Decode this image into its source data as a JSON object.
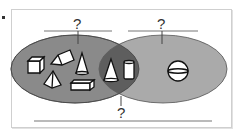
{
  "diagram": {
    "type": "venn",
    "sets": [
      {
        "id": "left",
        "label": "?",
        "color": "#8a8a8a",
        "items": [
          "cube",
          "triangular-prism",
          "cone",
          "square-pyramid",
          "rectangular-prism"
        ]
      },
      {
        "id": "right",
        "label": "?",
        "color": "#aaaaaa",
        "items": [
          "sphere"
        ]
      }
    ],
    "intersection": {
      "label": "?",
      "color": "#5e5e5e",
      "items": [
        "cone",
        "cylinder"
      ]
    },
    "labels": {
      "left": "?",
      "right": "?",
      "bottom": "?"
    }
  }
}
